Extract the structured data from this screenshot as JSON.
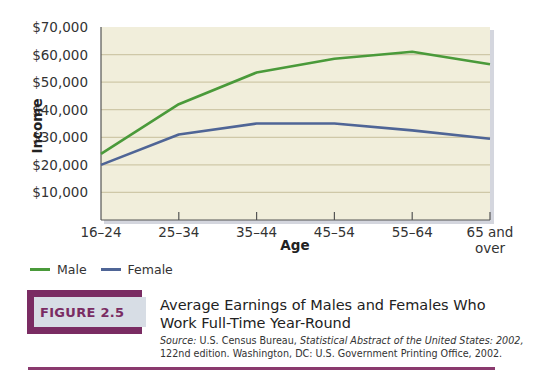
{
  "chart_data": {
    "type": "line",
    "title": "Average Earnings of Males and Females Who Work Full-Time Year-Round",
    "xlabel": "Age",
    "ylabel": "Income",
    "categories": [
      "16–24",
      "25–34",
      "35–44",
      "45–54",
      "55–64",
      "65 and over"
    ],
    "series": [
      {
        "name": "Male",
        "color": "#4a9a3a",
        "values": [
          24000,
          42000,
          53500,
          58500,
          61000,
          56500
        ]
      },
      {
        "name": "Female",
        "color": "#4f6596",
        "values": [
          20000,
          31000,
          35000,
          35000,
          32500,
          29500
        ]
      }
    ],
    "ylim": [
      0,
      70000
    ],
    "yticks": [
      10000,
      20000,
      30000,
      40000,
      50000,
      60000,
      70000
    ],
    "ytick_labels": [
      "$10,000",
      "$20,000",
      "$30,000",
      "$40,000",
      "$50,000",
      "$60,000",
      "$70,000"
    ],
    "grid": true,
    "legend_position": "bottom-left",
    "plot_background": "#f1eedb"
  },
  "axis": {
    "x_title": "Age",
    "y_title": "Income",
    "x_labels": [
      {
        "line1": "16–24",
        "line2": ""
      },
      {
        "line1": "25–34",
        "line2": ""
      },
      {
        "line1": "35–44",
        "line2": ""
      },
      {
        "line1": "45–54",
        "line2": ""
      },
      {
        "line1": "55–64",
        "line2": ""
      },
      {
        "line1": "65 and",
        "line2": "over"
      }
    ]
  },
  "legend": {
    "items": [
      {
        "label": "Male",
        "color": "#4a9a3a"
      },
      {
        "label": "Female",
        "color": "#4f6596"
      }
    ]
  },
  "figure": {
    "label": "FIGURE 2.5",
    "title": "Average Earnings of Males and Females Who Work Full-Time Year-Round",
    "source_prefix": "Source:",
    "source_org": " U.S. Census Bureau, ",
    "source_pub": "Statistical Abstract of the United States: 2002,",
    "source_rest": "122nd edition. Washington, DC: U.S. Government Printing Office, 2002.",
    "accent_color": "#7a2c63"
  }
}
